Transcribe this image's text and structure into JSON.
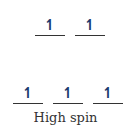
{
  "diagram": {
    "title": "High spin",
    "upper_level": {
      "orbitals": [
        {
          "electrons": "↿",
          "spin": "up"
        },
        {
          "electrons": "↿",
          "spin": "up"
        }
      ]
    },
    "lower_level": {
      "orbitals": [
        {
          "electrons": "↿",
          "spin": "up"
        },
        {
          "electrons": "↿",
          "spin": "up"
        },
        {
          "electrons": "↿",
          "spin": "up"
        }
      ]
    },
    "colors": {
      "arrow": "#1a3a6e",
      "line": "#333333",
      "text": "#333333"
    }
  }
}
